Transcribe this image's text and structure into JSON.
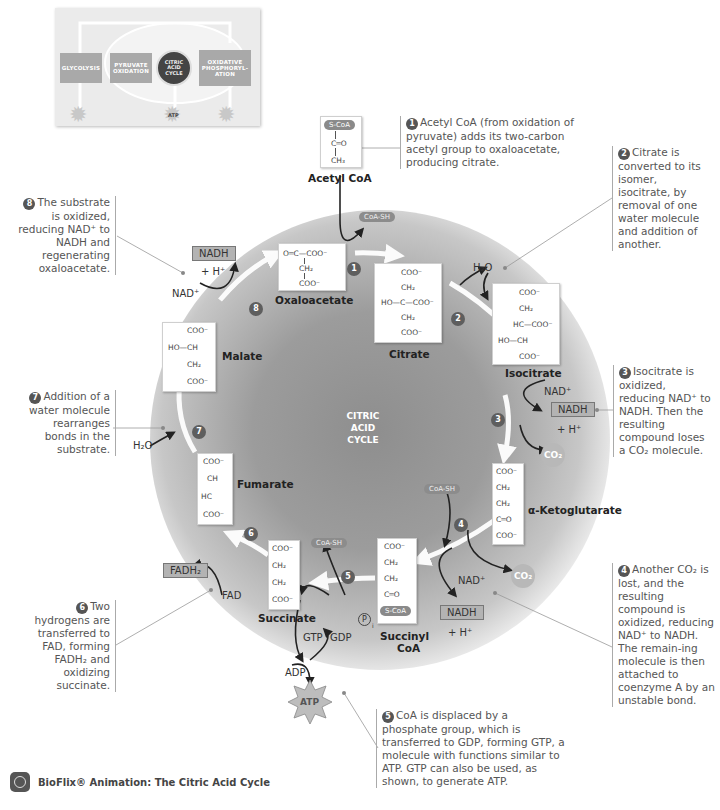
{
  "inset": {
    "glycolysis": "GLYCOLYSIS",
    "pyruvate_oxidation": "PYRUVATE OXIDATION",
    "citric_acid_cycle": "CITRIC ACID CYCLE",
    "oxidative_phosphorylation": "OXIDATIVE PHOSPHORYL-ATION",
    "atp": "ATP"
  },
  "center_label": [
    "CITRIC",
    "ACID",
    "CYCLE"
  ],
  "molecules": {
    "acetyl_coa": {
      "name": "Acetyl CoA",
      "lines": [
        "S-CoA",
        "C═O",
        "CH₃"
      ]
    },
    "oxaloacetate": {
      "name": "Oxaloacetate",
      "lines": [
        "O═C—COO⁻",
        "CH₂",
        "COO⁻"
      ]
    },
    "citrate": {
      "name": "Citrate",
      "lines": [
        "COO⁻",
        "CH₂",
        "HO—C—COO⁻",
        "CH₂",
        "COO⁻"
      ]
    },
    "isocitrate": {
      "name": "Isocitrate",
      "lines": [
        "COO⁻",
        "CH₂",
        "HC—COO⁻",
        "HO—CH",
        "COO⁻"
      ]
    },
    "alpha_ketoglutarate": {
      "name": "α-Ketoglutarate",
      "lines": [
        "COO⁻",
        "CH₂",
        "CH₂",
        "C═O",
        "COO⁻"
      ]
    },
    "succinyl_coa": {
      "name": "Succinyl CoA",
      "name_lines": [
        "Succinyl",
        "CoA"
      ],
      "lines": [
        "COO⁻",
        "CH₂",
        "CH₂",
        "C═O",
        "S-CoA"
      ]
    },
    "succinate": {
      "name": "Succinate",
      "lines": [
        "COO⁻",
        "CH₂",
        "CH₂",
        "COO⁻"
      ]
    },
    "fumarate": {
      "name": "Fumarate",
      "lines": [
        "COO⁻",
        "CH",
        "HC",
        "COO⁻"
      ]
    },
    "malate": {
      "name": "Malate",
      "lines": [
        "COO⁻",
        "HO—CH",
        "CH₂",
        "COO⁻"
      ]
    }
  },
  "steps": [
    "1",
    "2",
    "3",
    "4",
    "5",
    "6",
    "7",
    "8"
  ],
  "cofactors": {
    "coa_sh_1": "CoA-SH",
    "h2o_2": "H₂O",
    "nad_3": "NAD⁺",
    "nadh_3": "NADH",
    "h_3": "+ H⁺",
    "co2_3": "CO₂",
    "coa_sh_4": "CoA-SH",
    "nad_4": "NAD⁺",
    "nadh_4": "NADH",
    "h_4": "+ H⁺",
    "co2_4": "CO₂",
    "coa_sh_5": "CoA-SH",
    "pi_5": "P",
    "pi_sub": "i",
    "gtp": "GTP",
    "gdp": "GDP",
    "adp": "ADP",
    "atp": "ATP",
    "fad": "FAD",
    "fadh2": "FADH₂",
    "h2o_7": "H₂O",
    "nad_8": "NAD⁺",
    "nadh_8": "NADH",
    "h_8": "+ H⁺"
  },
  "notes": {
    "n1": "Acetyl CoA (from oxidation of pyruvate) adds its two-carbon acetyl group to oxaloacetate, producing citrate.",
    "n2": "Citrate is converted to its isomer, isocitrate, by removal of one water molecule and addition of another.",
    "n3": "Isocitrate is oxidized, reducing NAD⁺ to NADH. Then the resulting compound loses a CO₂ molecule.",
    "n4": "Another CO₂ is lost, and the resulting compound is oxidized, reducing NAD⁺ to NADH. The remain-ing molecule is then attached to coenzyme A by an unstable bond.",
    "n5": "CoA is displaced by a phosphate group, which is transferred to GDP, forming GTP, a molecule with functions similar to ATP. GTP can also be used, as shown, to generate ATP.",
    "n6": "Two hydrogens are transferred to FAD, forming FADH₂ and oxidizing succinate.",
    "n7": "Addition of a water molecule rearranges bonds in the substrate.",
    "n8": "The substrate is oxidized, reducing NAD⁺ to NADH and regenerating oxaloacetate."
  },
  "footer": {
    "text": "BioFlix® Animation: The Citric Acid Cycle"
  },
  "colors": {
    "cycle_dark": "#8e8e8e",
    "step_circle": "#5e5e5e",
    "cofactor_box": "#b3b3b3",
    "note_text": "#555555"
  }
}
